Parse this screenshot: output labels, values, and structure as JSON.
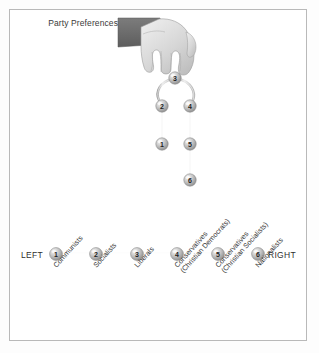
{
  "figure": {
    "title_line1": "Party",
    "title_line2": "Preferences",
    "left_label": "LEFT",
    "right_label": "RIGHT"
  },
  "chart_data": {
    "type": "diagram",
    "title": "Party Preferences",
    "subtype": "hanging-chain preference ordering over a left-right scale",
    "scale": {
      "axis_label_left": "LEFT",
      "axis_label_right": "RIGHT",
      "positions": [
        1,
        2,
        3,
        4,
        5,
        6
      ],
      "categories": [
        "Communists",
        "Socialists",
        "Liberals",
        "Conservatives (Christian Democrats)",
        "Conservatives (Christian Socialists)",
        "Nationalists"
      ],
      "category_lines": [
        [
          "Communists"
        ],
        [
          "Socialists"
        ],
        [
          "Liberals"
        ],
        [
          "Conservatives",
          "(Christian Democrats)"
        ],
        [
          "Conservatives",
          "(Christian Socialists)"
        ],
        [
          "Nationalists"
        ]
      ]
    },
    "chain": {
      "held_at": 3,
      "held_by": "hand",
      "left_branch": [
        3,
        2,
        1
      ],
      "right_branch": [
        3,
        4,
        5,
        6
      ],
      "nodes": [
        {
          "id": 3,
          "label": "3",
          "x": 175,
          "y": 78,
          "rank": 1
        },
        {
          "id": 2,
          "label": "2",
          "x": 162,
          "y": 106,
          "rank": 2
        },
        {
          "id": 4,
          "label": "4",
          "x": 190,
          "y": 106,
          "rank": 2
        },
        {
          "id": 1,
          "label": "1",
          "x": 162,
          "y": 144,
          "rank": 3
        },
        {
          "id": 5,
          "label": "5",
          "x": 190,
          "y": 144,
          "rank": 3
        },
        {
          "id": 6,
          "label": "6",
          "x": 190,
          "y": 180,
          "rank": 4
        }
      ]
    },
    "axis_nodes": [
      {
        "id": 1,
        "label": "1",
        "x": 56,
        "y": 254
      },
      {
        "id": 2,
        "label": "2",
        "x": 96,
        "y": 254
      },
      {
        "id": 3,
        "label": "3",
        "x": 137,
        "y": 254
      },
      {
        "id": 4,
        "label": "4",
        "x": 177,
        "y": 254
      },
      {
        "id": 5,
        "label": "5",
        "x": 218,
        "y": 254
      },
      {
        "id": 6,
        "label": "6",
        "x": 258,
        "y": 254
      }
    ],
    "colors": {
      "frame": "#b9b9b9",
      "node_fill": "#b0b0b0",
      "node_highlight": "#e8e8e8",
      "node_stroke": "#8a8a8a",
      "chain": "#c4c4c4",
      "hand": "#d8d8d8",
      "sleeve": "#6e6e6e",
      "text": "#3a3a3a",
      "background": "#ffffff"
    }
  }
}
